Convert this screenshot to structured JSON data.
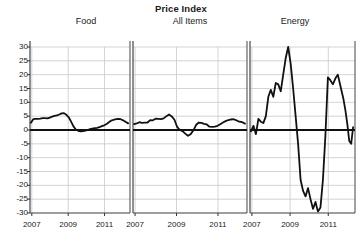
{
  "chart_data": {
    "type": "line",
    "title": "Price Index",
    "xlabel": "",
    "ylabel": "",
    "ylim": [
      -30,
      30
    ],
    "xlim": [
      2006.9,
      2012.4
    ],
    "grid": true,
    "legend_position": "none",
    "panel_layout": "1x3-faceted-shared-y",
    "yticks": [
      30,
      25,
      20,
      15,
      10,
      5,
      0,
      -5,
      -10,
      -15,
      -20,
      -25,
      -30
    ],
    "ytick_labels": [
      "30",
      "25",
      "20",
      "15",
      "10",
      "5",
      "0",
      "-5",
      "-10",
      "-15",
      "-20",
      "-25",
      "-30"
    ],
    "xticks": [
      2007,
      2009,
      2011
    ],
    "xtick_labels": [
      "2007",
      "2009",
      "2011"
    ],
    "panels": [
      {
        "name": "Food",
        "label": "Food",
        "x": [
          2006.95,
          2007.08,
          2007.21,
          2007.34,
          2007.47,
          2007.6,
          2007.73,
          2007.86,
          2007.99,
          2008.12,
          2008.25,
          2008.38,
          2008.51,
          2008.64,
          2008.77,
          2008.9,
          2009.03,
          2009.16,
          2009.29,
          2009.42,
          2009.55,
          2009.68,
          2009.81,
          2009.94,
          2010.07,
          2010.2,
          2010.33,
          2010.46,
          2010.59,
          2010.72,
          2010.85,
          2010.98,
          2011.11,
          2011.24,
          2011.37,
          2011.5,
          2011.63,
          2011.76,
          2011.89,
          2012.02,
          2012.15,
          2012.3
        ],
        "values": [
          2.6,
          3.9,
          4.0,
          4.0,
          4.1,
          4.3,
          4.3,
          4.2,
          4.5,
          4.8,
          5.1,
          5.3,
          5.6,
          6.0,
          6.1,
          5.5,
          4.6,
          3.0,
          1.3,
          0.2,
          -0.3,
          -0.5,
          -0.4,
          -0.2,
          0.0,
          0.3,
          0.5,
          0.7,
          0.8,
          1.0,
          1.4,
          1.7,
          2.2,
          2.8,
          3.4,
          3.7,
          3.9,
          4.0,
          3.9,
          3.5,
          3.0,
          2.4
        ]
      },
      {
        "name": "All Items",
        "label": "All Items",
        "x": [
          2006.95,
          2007.08,
          2007.21,
          2007.34,
          2007.47,
          2007.6,
          2007.73,
          2007.86,
          2007.99,
          2008.12,
          2008.25,
          2008.38,
          2008.51,
          2008.64,
          2008.77,
          2008.9,
          2009.03,
          2009.16,
          2009.29,
          2009.42,
          2009.55,
          2009.68,
          2009.81,
          2009.94,
          2010.07,
          2010.2,
          2010.33,
          2010.46,
          2010.59,
          2010.72,
          2010.85,
          2010.98,
          2011.11,
          2011.24,
          2011.37,
          2011.5,
          2011.63,
          2011.76,
          2011.89,
          2012.02,
          2012.15,
          2012.3
        ],
        "values": [
          2.1,
          2.4,
          2.8,
          2.6,
          2.7,
          2.7,
          3.6,
          3.5,
          4.1,
          4.0,
          3.9,
          4.2,
          5.0,
          5.6,
          4.9,
          3.7,
          1.1,
          0.0,
          -0.4,
          -1.3,
          -2.1,
          -1.5,
          -0.2,
          1.8,
          2.7,
          2.6,
          2.2,
          2.0,
          1.2,
          1.1,
          1.2,
          1.5,
          2.1,
          2.7,
          3.2,
          3.6,
          3.8,
          3.9,
          3.5,
          3.0,
          2.9,
          2.3
        ]
      },
      {
        "name": "Energy",
        "label": "Energy",
        "x": [
          2006.95,
          2007.08,
          2007.21,
          2007.34,
          2007.47,
          2007.6,
          2007.73,
          2007.86,
          2007.99,
          2008.12,
          2008.25,
          2008.38,
          2008.51,
          2008.64,
          2008.77,
          2008.9,
          2009.03,
          2009.16,
          2009.29,
          2009.42,
          2009.55,
          2009.68,
          2009.81,
          2009.94,
          2010.07,
          2010.2,
          2010.33,
          2010.46,
          2010.59,
          2010.72,
          2010.85,
          2010.98,
          2011.11,
          2011.24,
          2011.37,
          2011.5,
          2011.63,
          2011.76,
          2011.89,
          2012.02,
          2012.15,
          2012.3
        ],
        "values": [
          -0.5,
          1.5,
          -1.5,
          4.0,
          3.0,
          2.5,
          5.0,
          12.0,
          14.5,
          12.0,
          17.0,
          16.5,
          14.0,
          20.0,
          26.0,
          30.0,
          24.0,
          15.0,
          5.0,
          -5.0,
          -18.0,
          -22.0,
          -24.0,
          -21.0,
          -25.0,
          -28.5,
          -26.0,
          -29.5,
          -28.0,
          -18.0,
          -2.0,
          19.0,
          18.0,
          16.5,
          11.0,
          7.0,
          5.5,
          3.5,
          5.5,
          9.0,
          12.0,
          14.0
        ]
      }
    ],
    "panels_extra_energy_tail": {
      "x": [
        2011.4,
        2011.5,
        2011.6,
        2011.7,
        2011.8,
        2011.9,
        2012.0,
        2012.1,
        2012.2,
        2012.3
      ],
      "values": [
        19.0,
        20.0,
        17.0,
        14.0,
        11.0,
        7.0,
        2.0,
        -4.0,
        -5.0,
        1.0
      ]
    },
    "series_color": "#111111",
    "grid_color": "#c8c8c8",
    "axis_color": "#555555",
    "zero_line_color": "#111111",
    "background": "#ffffff"
  }
}
